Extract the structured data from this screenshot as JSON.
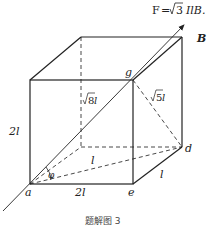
{
  "formula": {
    "lhs": "F",
    "eq": "=",
    "sqrt_arg": "3",
    "rhs": "IlB."
  },
  "labels": {
    "B": "B",
    "g": "g",
    "a": "a",
    "e": "e",
    "d": "d",
    "phi": "φ",
    "height": "2l",
    "bottom_front": "2l",
    "depth_right": "l",
    "diag_ad": "l",
    "diag_ag_sqrt": "8",
    "diag_ag_suffix": " l",
    "diag_gd_sqrt": "5",
    "diag_gd_suffix": " l"
  },
  "caption": "题解图 3",
  "colors": {
    "stroke": "#222222",
    "background": "#ffffff"
  }
}
